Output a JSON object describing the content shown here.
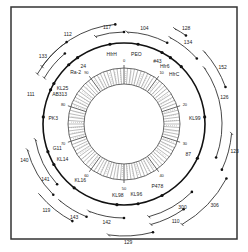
{
  "frame": {
    "x": 11,
    "y": 7,
    "w": 226,
    "h": 232,
    "stroke": "#333333"
  },
  "center": {
    "x": 124,
    "y": 124
  },
  "rings": {
    "main_radius": 81,
    "inner_outer_radius": 56,
    "inner_inner_radius": 40,
    "stroke": "#111111"
  },
  "map_markers": [
    {
      "label": "HfrH",
      "angle": -100
    },
    {
      "label": "PEO",
      "angle": -80
    },
    {
      "label": "#43",
      "angle": -62
    },
    {
      "label": "Hfr6",
      "angle": -55
    },
    {
      "label": "HfrC",
      "angle": -45
    },
    {
      "label": "24",
      "angle": -125
    },
    {
      "label": "Ra-2",
      "angle": -133
    },
    {
      "label": "KL25",
      "angle": -150
    },
    {
      "label": "AB313",
      "angle": -155
    },
    {
      "label": "PK3",
      "angle": -175
    },
    {
      "label": "G11",
      "angle": 160
    },
    {
      "label": "KL14",
      "angle": 150
    },
    {
      "label": "KL16",
      "angle": 128
    },
    {
      "label": "KL98",
      "angle": 95
    },
    {
      "label": "KL96",
      "angle": 80
    },
    {
      "label": "P478",
      "angle": 62
    },
    {
      "label": "87",
      "angle": 25
    },
    {
      "label": "KL99",
      "angle": -5
    }
  ],
  "outer_arcs": [
    {
      "label": "112",
      "r": 100,
      "start": -150,
      "end": -95,
      "label_angle": -122
    },
    {
      "label": "117",
      "r": 92,
      "start": -108,
      "end": -90,
      "label_angle": -100
    },
    {
      "label": "104",
      "r": 92,
      "start": -88,
      "end": -62,
      "label_angle": -78
    },
    {
      "label": "128",
      "r": 108,
      "start": -62,
      "end": -55,
      "label_angle": -57
    },
    {
      "label": "134",
      "r": 98,
      "start": -62,
      "end": -42,
      "label_angle": -52
    },
    {
      "label": "152",
      "r": 108,
      "start": -42,
      "end": -20,
      "label_angle": -30
    },
    {
      "label": "126",
      "r": 98,
      "start": -35,
      "end": 20,
      "label_angle": -15
    },
    {
      "label": "123",
      "r": 108,
      "start": 5,
      "end": 25,
      "label_angle": 14
    },
    {
      "label": "133",
      "r": 100,
      "start": -145,
      "end": -125,
      "label_angle": -140
    },
    {
      "label": "111",
      "r": 92,
      "start": -150,
      "end": -130,
      "label_angle": -162
    },
    {
      "label": "140",
      "r": 100,
      "start": -195,
      "end": -225,
      "label_angle": 160
    },
    {
      "label": "141",
      "r": 90,
      "start": -190,
      "end": -222,
      "label_angle": 145
    },
    {
      "label": "119",
      "r": 110,
      "start": 140,
      "end": 118,
      "label_angle": 132
    },
    {
      "label": "143",
      "r": 100,
      "start": 130,
      "end": 112,
      "label_angle": 118
    },
    {
      "label": "142",
      "r": 94,
      "start": 112,
      "end": 90,
      "label_angle": 100
    },
    {
      "label": "129",
      "r": 112,
      "start": 98,
      "end": 75,
      "label_angle": 88
    },
    {
      "label": "110",
      "r": 104,
      "start": 75,
      "end": 55,
      "label_angle": 62
    },
    {
      "label": "300",
      "r": 96,
      "start": 75,
      "end": 45,
      "label_angle": 55
    },
    {
      "label": "306",
      "r": 116,
      "start": 60,
      "end": 28,
      "label_angle": 42
    }
  ],
  "inner_scale": {
    "ticks_major": [
      "0",
      "10",
      "20",
      "30",
      "40",
      "50",
      "60",
      "70",
      "80",
      "90"
    ],
    "labels": {
      "0": "0",
      "10": "10",
      "20": "20",
      "30": "30",
      "40": "40",
      "50": "50",
      "60": "60",
      "70": "70",
      "80": "80",
      "90": "90"
    }
  }
}
